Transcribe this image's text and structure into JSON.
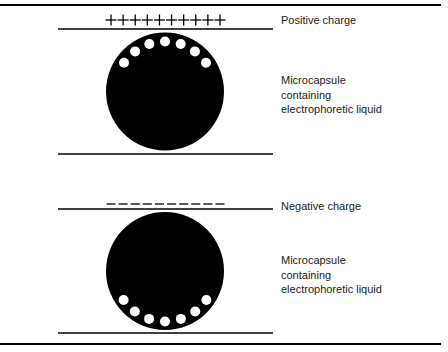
{
  "colors": {
    "ink": "#000000",
    "particle": "#ffffff",
    "text": "#222222",
    "background": "#ffffff"
  },
  "panels": [
    {
      "id": "positive",
      "charge_label": "Positive charge",
      "charge_symbol": "+",
      "charge_count": 10,
      "capsule_label_lines": [
        "Microcapsule",
        "containing",
        "electrophoretic liquid"
      ],
      "particle_position": "top",
      "particle_count": 7
    },
    {
      "id": "negative",
      "charge_label": "Negative charge",
      "charge_symbol": "−",
      "charge_count": 10,
      "capsule_label_lines": [
        "Microcapsule",
        "containing",
        "electrophoretic liquid"
      ],
      "particle_position": "bottom",
      "particle_count": 7
    }
  ]
}
